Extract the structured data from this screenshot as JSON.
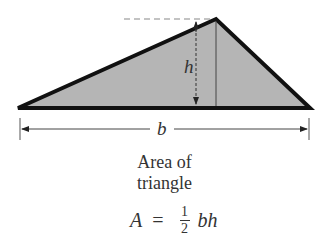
{
  "diagram": {
    "shape": "triangle",
    "fill_color": "#b5b5b5",
    "stroke_color": "#111111",
    "vertices": {
      "left": [
        18,
        108
      ],
      "apex": [
        216,
        19
      ],
      "right": [
        310,
        108
      ]
    },
    "labels": {
      "height": "h",
      "base": "b"
    }
  },
  "caption": {
    "line1": "Area of",
    "line2": "triangle"
  },
  "formula": {
    "lhs": "A",
    "equals": "=",
    "numerator": "1",
    "denominator": "2",
    "rhs": "bh"
  }
}
